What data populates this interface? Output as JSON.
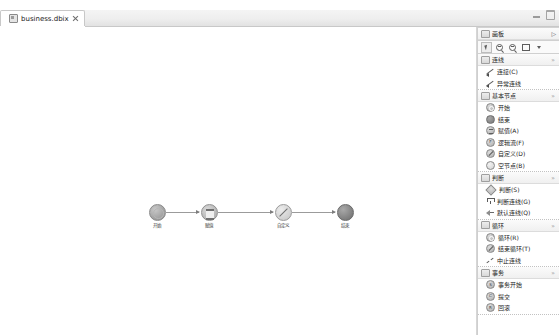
{
  "window": {
    "minimize_label": "minimize",
    "maximize_label": "maximize"
  },
  "tab": {
    "label": "business.dbix",
    "icon": "file-icon",
    "close": "close-icon"
  },
  "canvas": {
    "nodes": [
      {
        "id": "start",
        "label": "开始",
        "shape": "start",
        "x": 157,
        "y": 177
      },
      {
        "id": "assign",
        "label": "赋值",
        "shape": "assign",
        "x": 209,
        "y": 177
      },
      {
        "id": "custom",
        "label": "自定义",
        "shape": "custom",
        "x": 283,
        "y": 177
      },
      {
        "id": "end",
        "label": "结束",
        "shape": "end",
        "x": 345,
        "y": 177
      }
    ],
    "edges": [
      {
        "from": "start",
        "to": "assign"
      },
      {
        "from": "assign",
        "to": "custom"
      },
      {
        "from": "custom",
        "to": "end"
      }
    ]
  },
  "palette": {
    "title": "画板",
    "title_chevron": "▷",
    "toolbar": [
      {
        "name": "select-tool",
        "icon": "cursor-icon",
        "selected": true
      },
      {
        "name": "zoom-in-tool",
        "icon": "zoom-in-icon",
        "selected": false
      },
      {
        "name": "zoom-out-tool",
        "icon": "zoom-out-icon",
        "selected": false
      },
      {
        "name": "marquee-tool",
        "icon": "rectangle-icon",
        "selected": false
      },
      {
        "name": "tool-dropdown",
        "icon": "caret-down-icon",
        "selected": false
      }
    ],
    "sections": [
      {
        "title": "连线",
        "badge": "»",
        "items": [
          {
            "label": "连接(C)",
            "icon": "arrow-line-icon"
          },
          {
            "label": "异常连线",
            "icon": "arrow-line-icon"
          }
        ]
      },
      {
        "title": "基本节点",
        "badge": "»",
        "items": [
          {
            "label": "开始",
            "icon": "start-node-icon"
          },
          {
            "label": "结束",
            "icon": "end-node-icon"
          },
          {
            "label": "赋值(A)",
            "icon": "assign-node-icon"
          },
          {
            "label": "逻辑流(F)",
            "icon": "logic-node-icon"
          },
          {
            "label": "自定义(D)",
            "icon": "custom-node-icon"
          },
          {
            "label": "空节点(B)",
            "icon": "empty-node-icon"
          }
        ]
      },
      {
        "title": "判断",
        "badge": "»",
        "items": [
          {
            "label": "判断(S)",
            "icon": "decision-node-icon"
          },
          {
            "label": "判断连线(G)",
            "icon": "decision-link-icon"
          },
          {
            "label": "默认连线(Q)",
            "icon": "default-link-icon"
          }
        ]
      },
      {
        "title": "循环",
        "badge": "»",
        "items": [
          {
            "label": "循环(R)",
            "icon": "loop-node-icon"
          },
          {
            "label": "结束循环(T)",
            "icon": "loop-end-node-icon"
          },
          {
            "label": "中止连线",
            "icon": "abort-link-icon"
          }
        ]
      },
      {
        "title": "事务",
        "badge": "»",
        "items": [
          {
            "label": "事务开始",
            "icon": "transaction-start-icon"
          },
          {
            "label": "提交",
            "icon": "commit-icon"
          },
          {
            "label": "回滚",
            "icon": "rollback-icon"
          }
        ]
      }
    ]
  }
}
